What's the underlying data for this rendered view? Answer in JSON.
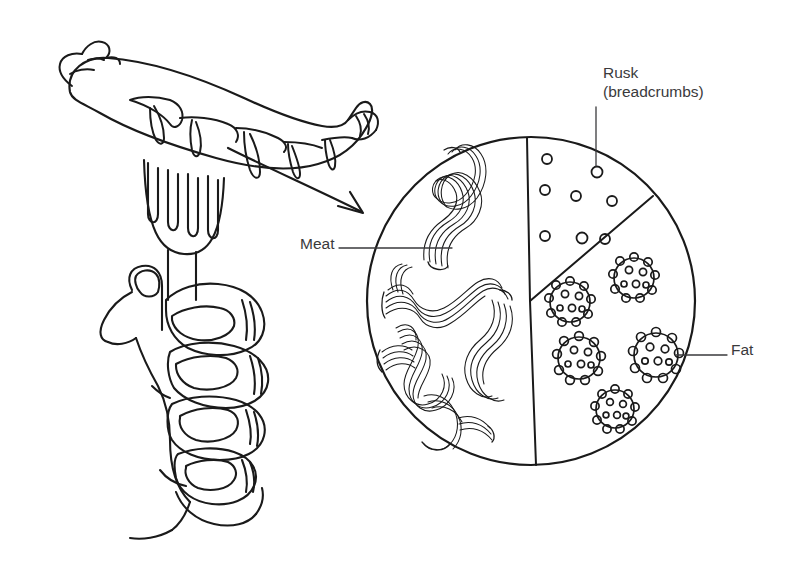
{
  "figure": {
    "background_color": "#ffffff",
    "ink_color": "#1a1a1a",
    "text_color": "#3a3a3c",
    "width": 800,
    "height": 562
  },
  "labels": {
    "rusk_line1": "Rusk",
    "rusk_line2": "(breadcrumbs)",
    "meat": "Meat",
    "fat": "Fat"
  },
  "diagram": {
    "circle": {
      "cx": 531,
      "cy": 301,
      "r": 164
    },
    "segments": [
      {
        "name": "meat",
        "label_ref": "labels.meat"
      },
      {
        "name": "rusk",
        "label_ref": "labels.rusk_line1"
      },
      {
        "name": "fat",
        "label_ref": "labels.fat"
      }
    ],
    "rusk_particles": [
      {
        "cx": 547,
        "cy": 159,
        "r": 5
      },
      {
        "cx": 597,
        "cy": 172,
        "r": 5.5
      },
      {
        "cx": 545,
        "cy": 190,
        "r": 5
      },
      {
        "cx": 576,
        "cy": 196,
        "r": 5
      },
      {
        "cx": 612,
        "cy": 201,
        "r": 5
      },
      {
        "cx": 545,
        "cy": 236,
        "r": 5
      },
      {
        "cx": 582,
        "cy": 238,
        "r": 5.5
      },
      {
        "cx": 605,
        "cy": 239,
        "r": 5
      }
    ],
    "fat_globules": [
      {
        "cx": 634,
        "cy": 278,
        "r": 20
      },
      {
        "cx": 570,
        "cy": 302,
        "r": 20
      },
      {
        "cx": 579,
        "cy": 358,
        "r": 21
      },
      {
        "cx": 656,
        "cy": 355,
        "r": 22
      },
      {
        "cx": 615,
        "cy": 409,
        "r": 19
      }
    ]
  },
  "leaders": {
    "rusk": {
      "x1": 596,
      "y1": 107,
      "x2": 596,
      "y2": 166
    },
    "meat": {
      "x1": 339,
      "y1": 248,
      "x2": 452,
      "y2": 248
    },
    "fat": {
      "x1": 676,
      "y1": 355,
      "x2": 727,
      "y2": 355
    }
  },
  "arrow": {
    "name": "curved-arrow-sausage-to-diagram",
    "from": {
      "x": 228,
      "y": 148
    },
    "to": {
      "x": 363,
      "y": 213
    }
  },
  "sausage": {
    "name": "sausage-on-fork",
    "split_marks": 5
  },
  "hand": {
    "name": "fist-gripping-fork",
    "fingers": 4,
    "thumb": 1
  }
}
